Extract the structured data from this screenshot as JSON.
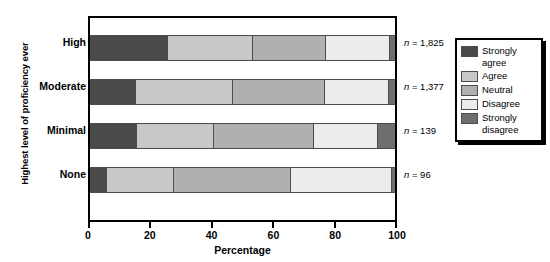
{
  "chart_data": {
    "type": "bar",
    "orientation": "horizontal",
    "stacked": true,
    "normalized": true,
    "title": "",
    "xlabel": "Percentage",
    "ylabel": "Highest level of proficiency ever",
    "xlim": [
      0,
      100
    ],
    "xticks": [
      0,
      20,
      40,
      60,
      80,
      100
    ],
    "xticklabels": [
      "0",
      "20",
      "40",
      "60",
      "80",
      "100"
    ],
    "grid": false,
    "legend_position": "right-outside",
    "categories": [
      "High",
      "Moderate",
      "Minimal",
      "None"
    ],
    "series": [
      {
        "name": "Strongly agree",
        "color": "#4a4a4a",
        "values": [
          25.5,
          15.0,
          15.5,
          5.5
        ]
      },
      {
        "name": "Agree",
        "color": "#c8c8c8",
        "values": [
          28.0,
          32.0,
          25.0,
          22.0
        ]
      },
      {
        "name": "Neutral",
        "color": "#b0b0b0",
        "values": [
          24.0,
          30.0,
          33.0,
          38.5
        ]
      },
      {
        "name": "Disagree",
        "color": "#ececec",
        "values": [
          21.0,
          21.0,
          21.0,
          33.0
        ]
      },
      {
        "name": "Strongly disagree",
        "color": "#6e6e6e",
        "values": [
          1.5,
          2.0,
          5.5,
          1.0
        ]
      }
    ],
    "annotations": [
      {
        "category": "High",
        "text": "n = 1,825",
        "n_value": "1,825"
      },
      {
        "category": "Moderate",
        "text": "n = 1,377",
        "n_value": "1,377"
      },
      {
        "category": "Minimal",
        "text": "n = 139",
        "n_value": "139"
      },
      {
        "category": "None",
        "text": "n = 96",
        "n_value": "96"
      }
    ]
  },
  "legend": {
    "items": [
      {
        "label": "Strongly agree",
        "color": "#4a4a4a"
      },
      {
        "label": "Agree",
        "color": "#c8c8c8"
      },
      {
        "label": "Neutral",
        "color": "#b0b0b0"
      },
      {
        "label": "Disagree",
        "color": "#ececec"
      },
      {
        "label": "Strongly disagree",
        "color": "#6e6e6e"
      }
    ]
  },
  "annotation_prefix": "n = "
}
